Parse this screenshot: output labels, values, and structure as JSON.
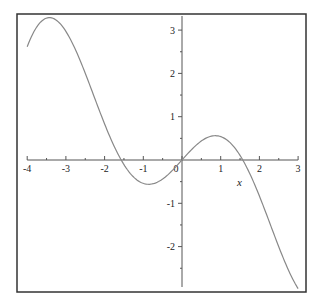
{
  "chart_data": {
    "type": "line",
    "title": "",
    "function": "x*cos(x)",
    "xlabel": "x",
    "ylabel": "",
    "xlim": [
      -4,
      3
    ],
    "ylim": [
      -2.97,
      3.3
    ],
    "grid": false,
    "legend": null,
    "x_ticks": [
      -4,
      -3,
      -2,
      -1,
      0,
      1,
      2,
      3
    ],
    "x_tick_labels": [
      "-4",
      "-3",
      "-2",
      "-1",
      "0",
      "1",
      "2",
      "3"
    ],
    "y_ticks": [
      -2,
      -1,
      1,
      2,
      3
    ],
    "y_tick_labels": [
      "-2",
      "-1",
      "1",
      "2",
      "3"
    ],
    "series": [
      {
        "name": "x cos(x)",
        "color": "#888888",
        "x": [
          -4,
          -3.75,
          -3.5,
          -3.25,
          -3,
          -2.75,
          -2.5,
          -2.25,
          -2,
          -1.75,
          -1.5,
          -1.25,
          -1,
          -0.75,
          -0.5,
          -0.25,
          0,
          0.25,
          0.5,
          0.75,
          1,
          1.25,
          1.5,
          1.75,
          2,
          2.25,
          2.5,
          2.75,
          3
        ],
        "y": [
          2.615,
          3.077,
          3.278,
          3.231,
          2.97,
          2.542,
          2.003,
          1.413,
          0.832,
          0.312,
          -0.106,
          -0.394,
          -0.54,
          -0.549,
          -0.439,
          -0.242,
          0,
          0.242,
          0.439,
          0.549,
          0.54,
          0.394,
          0.106,
          -0.312,
          -0.832,
          -1.413,
          -2.003,
          -2.542,
          -2.97
        ]
      }
    ]
  },
  "colors": {
    "frame": "#333333",
    "axis": "#555555",
    "curve": "#888888"
  }
}
